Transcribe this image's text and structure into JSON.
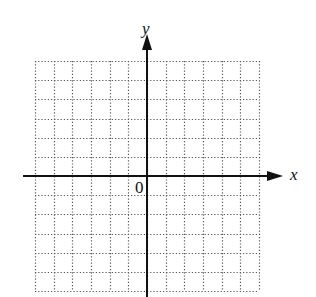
{
  "diagram": {
    "type": "coordinate-plane",
    "grid": {
      "left": 35,
      "right": 259,
      "top": 61,
      "bottom": 291,
      "columns": 12,
      "rows": 12,
      "line_style": "dotted",
      "line_color": "#555555"
    },
    "axes": {
      "origin": {
        "x": 147,
        "y": 176
      },
      "x_axis": {
        "label": "x",
        "start_x": 23,
        "end_x": 283,
        "arrow": "right"
      },
      "y_axis": {
        "label": "y",
        "start_y": 297,
        "end_y": 34,
        "arrow": "up"
      },
      "color": "#111111"
    },
    "origin_label": "0"
  },
  "labels": {
    "x_axis": "x",
    "y_axis": "y",
    "origin": "0"
  }
}
